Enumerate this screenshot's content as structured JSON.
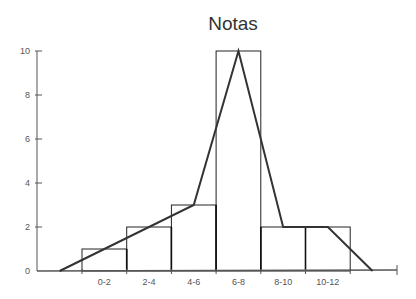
{
  "chart_data": {
    "type": "bar",
    "title": "Notas",
    "xlabel": "",
    "ylabel": "",
    "categories": [
      "0-2",
      "2-4",
      "4-6",
      "6-8",
      "8-10",
      "10-12"
    ],
    "values": [
      1,
      2,
      3,
      10,
      2,
      2
    ],
    "ylim": [
      0,
      10
    ],
    "yticks": [
      0,
      2,
      4,
      6,
      8,
      10
    ],
    "grid": false,
    "overlay": {
      "type": "line",
      "name": "frequency polygon",
      "points": [
        {
          "x": -1,
          "y": 0
        },
        {
          "x": 5,
          "y": 3
        },
        {
          "x": 7,
          "y": 10
        },
        {
          "x": 9,
          "y": 2
        },
        {
          "x": 11,
          "y": 2
        },
        {
          "x": 13,
          "y": 0
        }
      ]
    },
    "colors": {
      "bars_stroke": "#222222",
      "line": "#333333",
      "axis": "#555555"
    }
  }
}
